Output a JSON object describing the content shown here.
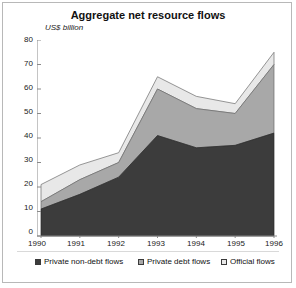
{
  "chart": {
    "title": "Aggregate net resource flows",
    "yaxis_label": "US$ billion",
    "yticks": [
      "80",
      "70",
      "60",
      "50",
      "40",
      "30",
      "20",
      "10",
      "0"
    ],
    "xticks": [
      "1990",
      "1991",
      "1992",
      "1993",
      "1994",
      "1995",
      "1996"
    ]
  },
  "legend": {
    "items": [
      {
        "label": "Private non-debt flows",
        "color": "#3c3c3c"
      },
      {
        "label": "Private debt flows",
        "color": "#a8a8a8"
      },
      {
        "label": "Official flows",
        "color": "#e8e8e8"
      }
    ]
  },
  "chart_data": {
    "type": "area",
    "stacked": true,
    "title": "Aggregate net resource flows",
    "xlabel": "",
    "ylabel": "US$ billion",
    "ylim": [
      0,
      80
    ],
    "yticks": [
      0,
      10,
      20,
      30,
      40,
      50,
      60,
      70,
      80
    ],
    "grid": false,
    "legend_position": "bottom",
    "x": [
      "1990",
      "1991",
      "1992",
      "1993",
      "1994",
      "1995",
      "1996"
    ],
    "series": [
      {
        "name": "Private non-debt flows",
        "color": "#3c3c3c",
        "values": [
          11,
          17,
          24,
          41,
          36,
          37,
          42
        ]
      },
      {
        "name": "Private debt flows",
        "color": "#a8a8a8",
        "values": [
          3,
          6,
          6,
          19,
          16,
          13,
          28
        ]
      },
      {
        "name": "Official flows",
        "color": "#e8e8e8",
        "values": [
          7,
          6,
          4,
          5,
          5,
          4,
          5
        ]
      }
    ],
    "totals": [
      21,
      29,
      34,
      65,
      57,
      54,
      75
    ]
  }
}
